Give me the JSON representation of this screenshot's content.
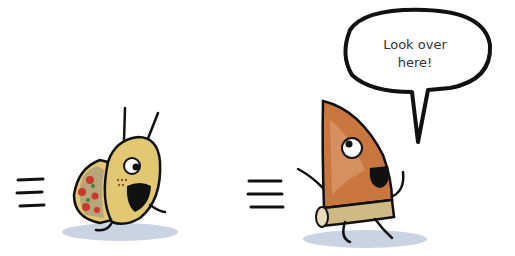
{
  "speech_bubble": {
    "line1": "Look over",
    "line2": "here!"
  },
  "characters": [
    {
      "name": "taco",
      "color": "#e3c874"
    },
    {
      "name": "pizza-slice",
      "color": "#c9773f"
    }
  ],
  "colors": {
    "outline": "#111111",
    "shadow": "#c9d3e3",
    "taco_shell": "#e3c874",
    "pizza": "#c9773f",
    "crust": "#cfb985"
  }
}
